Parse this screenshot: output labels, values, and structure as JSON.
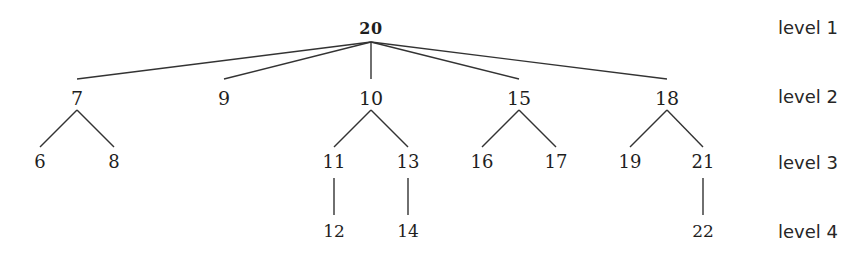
{
  "diagram": {
    "type": "tree",
    "root": "20",
    "nodes": [
      {
        "id": "n20",
        "label": "20",
        "level": 1,
        "x": 371,
        "y": 29
      },
      {
        "id": "n7",
        "label": "7",
        "level": 2,
        "x": 77,
        "y": 98
      },
      {
        "id": "n9",
        "label": "9",
        "level": 2,
        "x": 224,
        "y": 98
      },
      {
        "id": "n10",
        "label": "10",
        "level": 2,
        "x": 371,
        "y": 98
      },
      {
        "id": "n15",
        "label": "15",
        "level": 2,
        "x": 519,
        "y": 98
      },
      {
        "id": "n18",
        "label": "18",
        "level": 2,
        "x": 667,
        "y": 98
      },
      {
        "id": "n6",
        "label": "6",
        "level": 3,
        "x": 40,
        "y": 162
      },
      {
        "id": "n8",
        "label": "8",
        "level": 3,
        "x": 114,
        "y": 162
      },
      {
        "id": "n11",
        "label": "11",
        "level": 3,
        "x": 334,
        "y": 162
      },
      {
        "id": "n13",
        "label": "13",
        "level": 3,
        "x": 408,
        "y": 162
      },
      {
        "id": "n16",
        "label": "16",
        "level": 3,
        "x": 482,
        "y": 162
      },
      {
        "id": "n17",
        "label": "17",
        "level": 3,
        "x": 556,
        "y": 162
      },
      {
        "id": "n19",
        "label": "19",
        "level": 3,
        "x": 630,
        "y": 162
      },
      {
        "id": "n21",
        "label": "21",
        "level": 3,
        "x": 703,
        "y": 162
      },
      {
        "id": "n12",
        "label": "12",
        "level": 4,
        "x": 334,
        "y": 231
      },
      {
        "id": "n14",
        "label": "14",
        "level": 4,
        "x": 408,
        "y": 231
      },
      {
        "id": "n22",
        "label": "22",
        "level": 4,
        "x": 703,
        "y": 231
      }
    ],
    "edges": [
      {
        "from": "20",
        "to": "7",
        "x1": 371,
        "y1": 42,
        "x2": 77,
        "y2": 79
      },
      {
        "from": "20",
        "to": "9",
        "x1": 371,
        "y1": 42,
        "x2": 224,
        "y2": 79
      },
      {
        "from": "20",
        "to": "10",
        "x1": 371,
        "y1": 42,
        "x2": 371,
        "y2": 79
      },
      {
        "from": "20",
        "to": "15",
        "x1": 371,
        "y1": 42,
        "x2": 519,
        "y2": 79
      },
      {
        "from": "20",
        "to": "18",
        "x1": 371,
        "y1": 42,
        "x2": 667,
        "y2": 79
      },
      {
        "from": "7",
        "to": "6",
        "x1": 77,
        "y1": 110,
        "x2": 40,
        "y2": 147
      },
      {
        "from": "7",
        "to": "8",
        "x1": 77,
        "y1": 110,
        "x2": 114,
        "y2": 147
      },
      {
        "from": "10",
        "to": "11",
        "x1": 371,
        "y1": 110,
        "x2": 334,
        "y2": 147
      },
      {
        "from": "10",
        "to": "13",
        "x1": 371,
        "y1": 110,
        "x2": 408,
        "y2": 147
      },
      {
        "from": "15",
        "to": "16",
        "x1": 519,
        "y1": 110,
        "x2": 482,
        "y2": 147
      },
      {
        "from": "15",
        "to": "17",
        "x1": 519,
        "y1": 110,
        "x2": 556,
        "y2": 147
      },
      {
        "from": "18",
        "to": "19",
        "x1": 667,
        "y1": 110,
        "x2": 630,
        "y2": 147
      },
      {
        "from": "18",
        "to": "21",
        "x1": 667,
        "y1": 110,
        "x2": 703,
        "y2": 147
      },
      {
        "from": "11",
        "to": "12",
        "x1": 334,
        "y1": 178,
        "x2": 334,
        "y2": 215
      },
      {
        "from": "13",
        "to": "14",
        "x1": 408,
        "y1": 178,
        "x2": 408,
        "y2": 215
      },
      {
        "from": "21",
        "to": "22",
        "x1": 703,
        "y1": 178,
        "x2": 703,
        "y2": 215
      }
    ],
    "level_labels": [
      {
        "label": "level 1",
        "y": 28
      },
      {
        "label": "level 2",
        "y": 97
      },
      {
        "label": "level 3",
        "y": 163
      },
      {
        "label": "level 4",
        "y": 232
      }
    ],
    "colors": {
      "line": "#333333",
      "text": "#1e1e1e",
      "background": "#ffffff"
    }
  }
}
